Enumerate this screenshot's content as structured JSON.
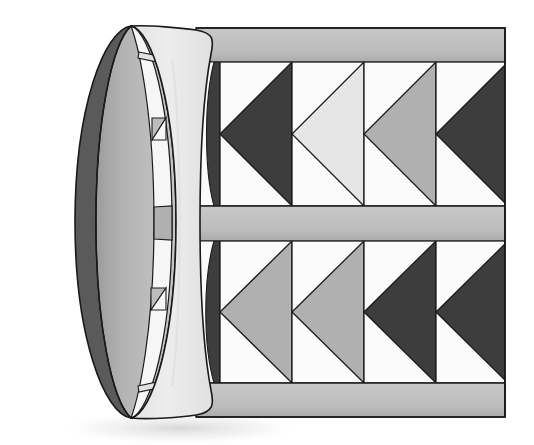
{
  "figure": {
    "canvas": {
      "width": 534,
      "height": 445,
      "background": "#ffffff"
    }
  },
  "palette": {
    "dark": "#3d3d3d",
    "mid_gray": "#b0b0b0",
    "pale_gray": "#e6e6e6",
    "white_cell": "#fbfbfb",
    "band_gray": "#bdbdbd",
    "band_gray_shade": "#a9a9a9",
    "cylinder_face": "#ededed",
    "cylinder_side": "#b8b8b8",
    "rim_dark": "#555555",
    "rim_edge": "#6d6d6d",
    "outline": "#1a1a1a",
    "shadow": "#e9e9e9"
  },
  "geometry": {
    "panel_left_x": 196,
    "panel_right_x": 505,
    "top_band": {
      "y_top": 28,
      "y_bottom": 62,
      "label": "top-rail"
    },
    "middle_band": {
      "y_top": 206,
      "y_bottom": 241,
      "label": "middle-rail"
    },
    "bottom_band": {
      "y_top": 383,
      "y_bottom": 417,
      "label": "bottom-rail"
    },
    "row_top": {
      "y_top": 62,
      "y_bottom": 206
    },
    "row_bottom": {
      "y_top": 241,
      "y_bottom": 383
    },
    "cell_width": 72,
    "cylinder": {
      "face_center_x": 118,
      "face_rx": 58,
      "face_ry": 197,
      "face_cy": 222,
      "front_edge_x": 200,
      "depth": 86
    }
  },
  "bands": [
    {
      "name": "top-rail",
      "color": "#bdbdbd"
    },
    {
      "name": "middle-rail",
      "color": "#bdbdbd"
    },
    {
      "name": "bottom-rail",
      "color": "#bdbdbd"
    }
  ],
  "chevron_rows": [
    {
      "row": "top",
      "cells": [
        {
          "index": 0,
          "fill": "dark",
          "partial": true,
          "note": "wraps onto cylinder curve"
        },
        {
          "index": 1,
          "fill": "dark",
          "partial": false
        },
        {
          "index": 2,
          "fill": "pale_gray",
          "partial": false
        },
        {
          "index": 3,
          "fill": "mid_gray",
          "partial": false
        },
        {
          "index": 4,
          "fill": "dark",
          "partial": false,
          "clipped_right": true
        }
      ]
    },
    {
      "row": "bottom",
      "cells": [
        {
          "index": 0,
          "fill": "dark",
          "partial": true,
          "note": "wraps onto cylinder curve"
        },
        {
          "index": 1,
          "fill": "mid_gray",
          "partial": false
        },
        {
          "index": 2,
          "fill": "mid_gray",
          "partial": false
        },
        {
          "index": 3,
          "fill": "dark",
          "partial": false
        },
        {
          "index": 4,
          "fill": "dark",
          "partial": false,
          "clipped_right": true
        }
      ]
    }
  ],
  "rim_features": {
    "notch_count": 2,
    "notches": [
      {
        "name": "upper-notch",
        "y": 128
      },
      {
        "name": "lower-notch",
        "y": 297
      }
    ],
    "middle_tab": {
      "name": "rim-middle-tab",
      "y_top": 206,
      "y_bottom": 241,
      "color": "#b0b0b0"
    }
  }
}
